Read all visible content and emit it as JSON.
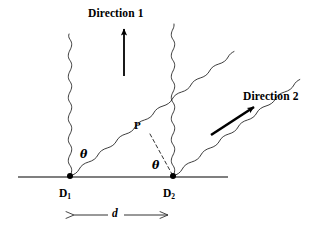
{
  "figure": {
    "type": "physics-diagram",
    "background_color": "#ffffff",
    "ink_color": "#000000",
    "baseline_color": "#555555"
  },
  "labels": {
    "direction_1": "Direction 1",
    "direction_2": "Direction 2",
    "detector_1_name": "D",
    "detector_1_sub": "1",
    "detector_2_name": "D",
    "detector_2_sub": "2",
    "point_p": "P",
    "theta_left": "θ",
    "theta_right": "θ",
    "separation": "d"
  },
  "geometry": {
    "baseline": {
      "x1": 18,
      "y1": 177,
      "x2": 228,
      "y2": 177
    },
    "detector_1": {
      "x": 70,
      "y": 176
    },
    "detector_2": {
      "x": 173,
      "y": 176
    },
    "point_p": {
      "x": 150,
      "y": 133
    },
    "dashed_line": {
      "x1": 150,
      "y1": 133,
      "x2": 172,
      "y2": 175
    },
    "arrow_direction_1": {
      "x1": 124,
      "y1": 76,
      "x2": 124,
      "y2": 26
    },
    "arrow_direction_2": {
      "x1": 212,
      "y1": 134,
      "x2": 258,
      "y2": 104
    },
    "dimension_arrow": {
      "x1": 72,
      "y": 215,
      "x2": 170
    }
  },
  "waves": {
    "vertical_1": {
      "from_x": 70,
      "from_y": 176,
      "to_y": 34,
      "amplitude": 3.0,
      "wavelength": 14
    },
    "vertical_2": {
      "from_x": 173,
      "from_y": 176,
      "to_y": 24,
      "amplitude": 3.0,
      "wavelength": 14
    },
    "diagonal_upper": {
      "start_x": 70,
      "start_y": 176,
      "angle_deg": 33,
      "amplitude": 3.0,
      "wavelength": 14
    },
    "diagonal_lower": {
      "start_x": 173,
      "start_y": 176,
      "angle_deg": 33,
      "amplitude": 3.0,
      "wavelength": 14
    }
  },
  "label_positions": {
    "direction_1": {
      "x": 88,
      "y": 8
    },
    "direction_2": {
      "x": 243,
      "y": 91
    },
    "detector_1": {
      "x": 59,
      "y": 188
    },
    "detector_2": {
      "x": 163,
      "y": 188
    },
    "point_p": {
      "x": 134,
      "y": 120
    },
    "theta_left": {
      "x": 80,
      "y": 149
    },
    "theta_right": {
      "x": 152,
      "y": 160
    },
    "separation": {
      "x": 115,
      "y": 207
    }
  }
}
